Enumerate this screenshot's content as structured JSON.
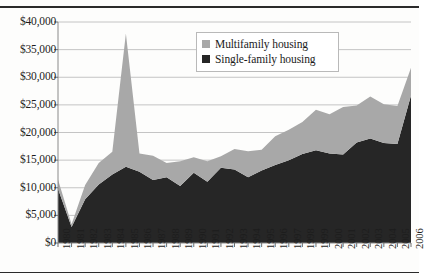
{
  "chart_data": {
    "type": "area",
    "stacked": true,
    "title": "",
    "xlabel": "",
    "ylabel": "",
    "ylim": [
      0,
      40000
    ],
    "ytick_labels": [
      "$0",
      "$5,000",
      "$10,000",
      "$15,000",
      "$20,000",
      "$25,000",
      "$30,000",
      "$35,000",
      "$40,000"
    ],
    "ytick_values": [
      0,
      5000,
      10000,
      15000,
      20000,
      25000,
      30000,
      35000,
      40000
    ],
    "grid": "horizontal",
    "legend_position": "top-right",
    "categories": [
      "1980",
      "1981",
      "1982",
      "1983",
      "1984",
      "1985",
      "1986",
      "1987",
      "1988",
      "1989",
      "1990",
      "1991",
      "1992",
      "1993",
      "1994",
      "1995",
      "1996",
      "1997",
      "1998",
      "1999",
      "2000",
      "2001",
      "2002",
      "2003",
      "2004",
      "2005",
      "2006"
    ],
    "series": [
      {
        "name": "Single-family housing",
        "color": "#262626",
        "values": [
          9800,
          2900,
          7900,
          10600,
          12400,
          13800,
          12900,
          11400,
          11900,
          10300,
          12700,
          11100,
          13600,
          13300,
          11900,
          13100,
          14100,
          15000,
          16100,
          16800,
          16200,
          16000,
          18200,
          18900,
          18100,
          17900,
          26700
        ]
      },
      {
        "name": "Multifamily housing",
        "color": "#a8a8a8",
        "values": [
          1700,
          500,
          2600,
          3900,
          4100,
          24100,
          3300,
          4400,
          2600,
          4500,
          2800,
          3700,
          2100,
          3700,
          4700,
          3800,
          5200,
          5500,
          5800,
          7300,
          7100,
          8600,
          6700,
          7600,
          7000,
          6900,
          5000
        ]
      }
    ],
    "totals": [
      11500,
      3400,
      10500,
      14500,
      16500,
      37900,
      16200,
      15800,
      14500,
      14800,
      15500,
      14800,
      15700,
      17000,
      16600,
      16900,
      19300,
      20500,
      21900,
      24100,
      23300,
      24600,
      24900,
      26500,
      25100,
      24800,
      31700
    ]
  },
  "legend": {
    "items": [
      {
        "label": "Multifamily housing",
        "color": "#a8a8a8"
      },
      {
        "label": "Single-family housing",
        "color": "#262626"
      }
    ]
  }
}
